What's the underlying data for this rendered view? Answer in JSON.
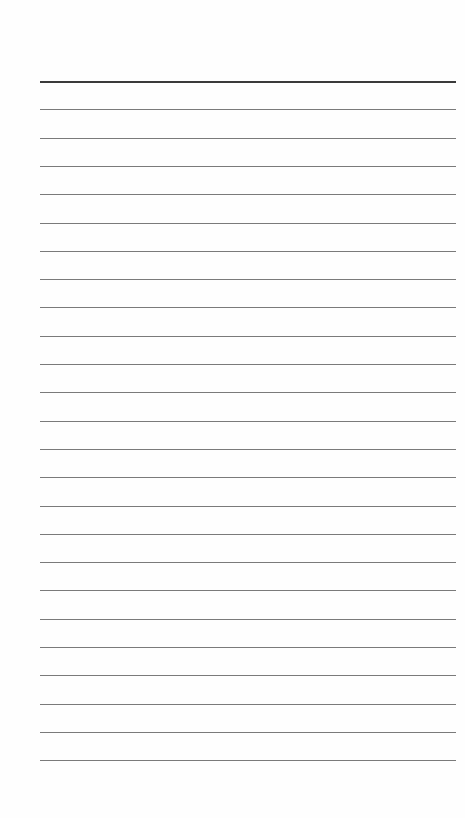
{
  "paper": {
    "type": "lined-notepaper",
    "line_count": 25,
    "first_line_y": 81,
    "line_spacing": 28.3,
    "line_left": 40,
    "line_right": 456,
    "colors": {
      "background": "#fefefe",
      "header_rule": "#3a3a3a",
      "rule": "#7a7a7a"
    }
  }
}
